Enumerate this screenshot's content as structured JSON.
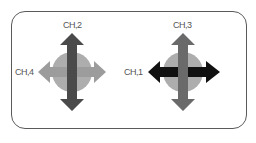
{
  "diagram": {
    "left_group": {
      "top_label": "CH,2",
      "side_label": "CH,4",
      "vertical_arrow_color": "#4a4a4a",
      "horizontal_arrow_color": "#9c9c9c",
      "pad_color": "#adadad"
    },
    "right_group": {
      "top_label": "CH,3",
      "side_label": "CH,1",
      "vertical_arrow_color": "#6a6a6a",
      "horizontal_arrow_color": "#111111",
      "pad_color": "#adadad"
    }
  }
}
